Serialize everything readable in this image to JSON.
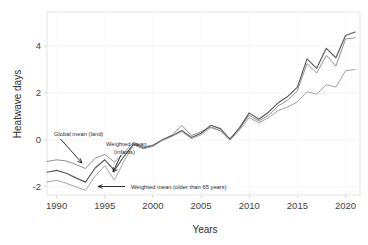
{
  "chart_data": {
    "type": "line",
    "title": "",
    "xlabel": "Years",
    "ylabel": "Heatwave days",
    "xlim": [
      1989,
      2021.5
    ],
    "ylim": [
      -2.35,
      5.45
    ],
    "xticks": [
      1990,
      1995,
      2000,
      2005,
      2010,
      2015,
      2020
    ],
    "xtick_labels": [
      "1990",
      "1995",
      "2000",
      "2005",
      "2010",
      "2015",
      "2020"
    ],
    "yticks": [
      -2,
      0,
      2,
      4
    ],
    "ytick_labels": [
      "-2",
      "0",
      "2",
      "4"
    ],
    "grid": true,
    "legend_position": "inline-annotations",
    "x": [
      1989,
      1990,
      1991,
      1992,
      1993,
      1994,
      1995,
      1996,
      1997,
      1998,
      1999,
      2000,
      2001,
      2002,
      2003,
      2004,
      2005,
      2006,
      2007,
      2008,
      2009,
      2010,
      2011,
      2012,
      2013,
      2014,
      2015,
      2016,
      2017,
      2018,
      2019,
      2020,
      2021
    ],
    "series": [
      {
        "name": "Global mean (land)",
        "color": "#8a8a8a",
        "values": [
          -0.92,
          -0.85,
          -0.9,
          -1.05,
          -1.22,
          -0.78,
          -0.62,
          -0.95,
          -0.55,
          -0.1,
          -0.3,
          -0.22,
          0.02,
          0.2,
          0.62,
          0.18,
          0.35,
          0.55,
          0.4,
          0.05,
          0.48,
          1.05,
          0.8,
          1.05,
          1.45,
          1.7,
          2.1,
          3.25,
          2.85,
          3.6,
          3.15,
          4.3,
          4.35
        ]
      },
      {
        "name": "Weighted mean (infants)",
        "color": "#595959",
        "values": [
          -1.38,
          -1.3,
          -1.42,
          -1.62,
          -1.8,
          -1.2,
          -0.85,
          -1.3,
          -0.7,
          -0.18,
          -0.35,
          -0.25,
          0.0,
          0.18,
          0.4,
          0.1,
          0.28,
          0.62,
          0.48,
          0.02,
          0.52,
          1.15,
          0.88,
          1.18,
          1.58,
          1.85,
          2.25,
          3.45,
          3.05,
          3.9,
          3.5,
          4.45,
          4.6
        ]
      },
      {
        "name": "Weighted mean (older than 65 years)",
        "color": "#9e9e9e",
        "values": [
          -1.8,
          -1.72,
          -1.85,
          -2.0,
          -2.15,
          -1.55,
          -1.1,
          -1.72,
          -0.9,
          -0.22,
          -0.38,
          -0.28,
          -0.02,
          0.15,
          0.35,
          0.05,
          0.22,
          0.52,
          0.38,
          -0.02,
          0.42,
          0.95,
          0.72,
          0.95,
          1.25,
          1.4,
          1.62,
          2.05,
          1.95,
          2.35,
          2.25,
          2.95,
          3.0
        ]
      }
    ],
    "annotations": [
      {
        "text": "Global mean (land)",
        "target_series": "Global mean (land)"
      },
      {
        "text": "Weighted mean",
        "text2": "(infants)",
        "target_series": "Weighted mean (infants)"
      },
      {
        "text": "Weighted mean (older than 65 years)",
        "target_series": "Weighted mean (older than 65 years)"
      }
    ]
  }
}
